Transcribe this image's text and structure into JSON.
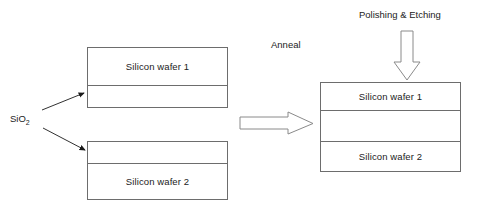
{
  "diagram": {
    "title_text": "",
    "labels": {
      "sio2": "SiO",
      "sio2_subscript": "2",
      "anneal": "Anneal",
      "polishing_etching": "Polishing & Etching"
    },
    "left_stack_top": {
      "name": "bonded-wafer-1-with-oxide",
      "layers": [
        {
          "label": "Silicon wafer 1"
        },
        {
          "label": ""
        }
      ]
    },
    "left_stack_bottom": {
      "name": "bonded-wafer-2-with-oxide",
      "layers": [
        {
          "label": ""
        },
        {
          "label": "Silicon wafer 2"
        }
      ]
    },
    "right_stack": {
      "name": "annealed-bonded-stack",
      "layers": [
        {
          "label": "Silicon wafer 1"
        },
        {
          "label": ""
        },
        {
          "label": "Silicon wafer 2"
        }
      ]
    },
    "arrows": {
      "anneal_arrow": "block-arrow-right",
      "polishing_arrow": "block-arrow-down",
      "sio2_pointer_upper": "thin-arrow-up-right",
      "sio2_pointer_lower": "thin-arrow-down-right"
    },
    "colors": {
      "stroke": "#6d6d6d",
      "text": "#222222",
      "background": "#ffffff",
      "thin_stroke": "#1a1a1a"
    }
  }
}
